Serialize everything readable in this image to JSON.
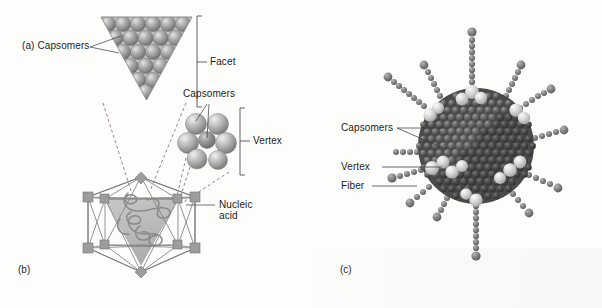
{
  "figure": {
    "background_color": "#fdfdfc",
    "ink_color": "#1c1c1c"
  },
  "panels": [
    {
      "id": "a",
      "label": "(a)",
      "caption_label": "(a) Capsomers"
    },
    {
      "id": "b",
      "label": "(b)"
    },
    {
      "id": "c",
      "label": "(c)"
    }
  ],
  "labels": {
    "a_capsomers": "(a) Capsomers",
    "facet": "Facet",
    "capsomers_vertex": "Capsomers",
    "vertex": "Vertex",
    "nucleic_acid_line1": "Nucleic",
    "nucleic_acid_line2": "acid",
    "panel_b": "(b)",
    "panel_c": "(c)",
    "c_capsomers": "Capsomers",
    "c_vertex": "Vertex",
    "c_fiber": "Fiber"
  },
  "structures": {
    "facet_triangle": {
      "name": "capsomer-facet-triangle",
      "rows": [
        6,
        5,
        4,
        3,
        2,
        1
      ],
      "total_capsomers": 21,
      "sphere_color": "#8e8e8e",
      "highlight_color": "#d6d6d6"
    },
    "vertex_cluster": {
      "name": "vertex-penton-cluster",
      "surrounding_capsomers": 6,
      "central_penton": 1,
      "sphere_color": "#a5a5a5"
    },
    "icosahedron": {
      "name": "icosahedron-capsid",
      "vertices": 12,
      "faces": 20,
      "wire_color": "#8a8a8a",
      "vertex_marker_color": "#9a9a9a",
      "facet_fill": "#b9b9b9",
      "nucleic_acid_color": "#8d8d8d"
    },
    "adenovirus": {
      "name": "adenovirus-model",
      "capsid_color": "#5c5c5c",
      "penton_color": "#d8d8d8",
      "fiber_color": "#7b7b7b",
      "fiber_count": 12,
      "fiber_bead_count": 9
    }
  }
}
